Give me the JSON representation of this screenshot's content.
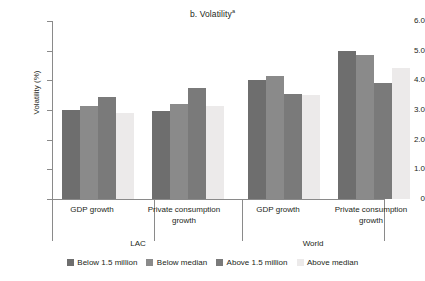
{
  "chart_data": {
    "type": "bar",
    "title": "b. Volatility",
    "title_superscript": "a",
    "xlabel": "",
    "ylabel": "Volatility (%)",
    "ylim": [
      0,
      6
    ],
    "ytick_labels": [
      "0",
      "1.0",
      "2.0",
      "3.0",
      "4.0",
      "5.0",
      "6.0"
    ],
    "ytick_values": [
      0,
      1,
      2,
      3,
      4,
      5,
      6
    ],
    "grid": false,
    "legend_position": "bottom",
    "group_labels": [
      "LAC",
      "World"
    ],
    "categories": [
      "GDP growth",
      "Private consumption growth",
      "GDP growth",
      "Private consumption growth"
    ],
    "category_lines": [
      [
        "GDP growth"
      ],
      [
        "Private consumption",
        "growth"
      ],
      [
        "GDP growth"
      ],
      [
        "Private consumption",
        "growth"
      ]
    ],
    "series": [
      {
        "name": "Below 1.5 million",
        "color": "#6e6e6e",
        "values": [
          3.0,
          2.95,
          4.0,
          5.0
        ]
      },
      {
        "name": "Below median",
        "color": "#8a8a8a",
        "values": [
          3.15,
          3.2,
          4.15,
          4.85
        ]
      },
      {
        "name": "Above 1.5 million",
        "color": "#7a7a7a",
        "values": [
          3.45,
          3.75,
          3.55,
          3.9
        ]
      },
      {
        "name": "Above median",
        "color": "#eceaea",
        "values": [
          2.9,
          3.15,
          3.5,
          4.4
        ]
      }
    ]
  },
  "legend": {
    "items": [
      {
        "label": "Below 1.5 million",
        "color": "#6e6e6e"
      },
      {
        "label": "Below median",
        "color": "#8a8a8a"
      },
      {
        "label": "Above 1.5 million",
        "color": "#7a7a7a"
      },
      {
        "label": "Above median",
        "color": "#eceaea"
      }
    ]
  }
}
